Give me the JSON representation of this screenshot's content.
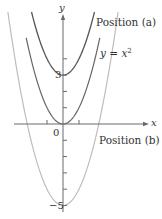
{
  "chart_data": {
    "type": "line",
    "title": "",
    "xlabel": "x",
    "ylabel": "y",
    "xlim": [
      -2.3,
      2.3
    ],
    "ylim": [
      -5,
      7
    ],
    "grid": false,
    "x_ticks": [
      -1,
      0,
      1
    ],
    "y_ticks": [
      -5,
      -4,
      -3,
      -2,
      -1,
      0,
      1,
      2,
      3,
      4
    ],
    "tick_labels": {
      "origin": "0",
      "y3": "3",
      "y_neg5": "−5"
    },
    "series": [
      {
        "name": "Position (a)",
        "equation": "y = x^2 + 3",
        "vertex": [
          0,
          3
        ],
        "color": "#555555"
      },
      {
        "name": "y = x^2",
        "equation": "y = x^2",
        "vertex": [
          0,
          0
        ],
        "color": "#666666"
      },
      {
        "name": "Position (b)",
        "equation": "y = x^2 - 5",
        "vertex": [
          0,
          -5
        ],
        "color": "#bdbdbd"
      }
    ],
    "annotations": [
      "Position (a)",
      "y = x^2",
      "Position (b)"
    ]
  },
  "labels": {
    "position_a": "Position (a)",
    "eq_base": "y = x",
    "eq_exp": "2",
    "position_b": "Position (b)",
    "axis_x": "x",
    "axis_y": "y",
    "origin": "0",
    "y3": "3",
    "y_neg5": "−5"
  },
  "colors": {
    "axis": "#6a6a6a",
    "curve_a": "#555555",
    "curve_base": "#666666",
    "curve_b": "#bdbdbd"
  }
}
